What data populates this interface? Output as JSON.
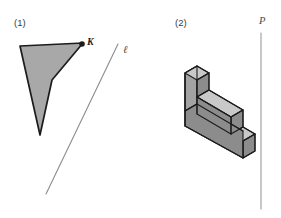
{
  "figure": {
    "width": 281,
    "height": 218,
    "background": "#ffffff",
    "panels": [
      {
        "id": "panel-1",
        "label": "(1)",
        "label_x": 14,
        "label_y": 26,
        "description": "A shaded concave quadrilateral with a marked vertex K, beside a slanted line named l",
        "shape": {
          "name": "concave-quadrilateral",
          "fill": "#a8a8a8",
          "stroke": "#1c1c1c",
          "stroke_width": 1.7,
          "points": "20,46 83,43 52,80 40,135"
        },
        "point": {
          "name": "K",
          "label": "K",
          "x": 82,
          "y": 44,
          "radius": 2.8,
          "color": "#1c1c1c",
          "label_x": 87,
          "label_y": 45
        },
        "line": {
          "name": "l",
          "label": "ℓ",
          "x1": 118,
          "y1": 44,
          "x2": 46,
          "y2": 194,
          "stroke": "#8c8c8c",
          "stroke_width": 1.1,
          "label_x": 123,
          "label_y": 53
        }
      },
      {
        "id": "panel-2",
        "label": "(2)",
        "label_x": 175,
        "label_y": 26,
        "description": "An isometric three-dimensional staircase block of three descending steps, beside a vertical line named P",
        "solid": {
          "name": "isometric-staircase-block",
          "steps": 3,
          "stroke": "#1c1c1c",
          "stroke_width": 1.1,
          "face_colors": {
            "top": "#c9c9c9",
            "front": "#8c8c8c",
            "side": "#a3a3a3"
          }
        },
        "line": {
          "name": "P",
          "label": "P",
          "x1": 261,
          "y1": 33,
          "x2": 261,
          "y2": 209,
          "stroke": "#9a9a9a",
          "stroke_width": 1.1,
          "label_x": 259,
          "label_y": 24
        }
      }
    ]
  }
}
